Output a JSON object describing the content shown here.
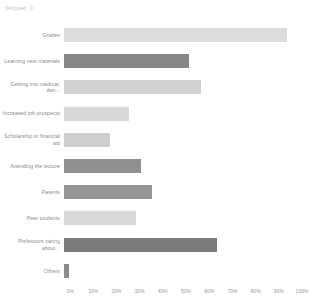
{
  "header": {
    "skipped_text": "Skipped: 0"
  },
  "chart_data": {
    "type": "bar",
    "orientation": "horizontal",
    "title": "",
    "xlabel": "",
    "ylabel": "",
    "xlim": [
      0,
      100
    ],
    "grid": false,
    "legend": "none",
    "tick_labels": [
      "0%",
      "10%",
      "20%",
      "30%",
      "40%",
      "50%",
      "60%",
      "70%",
      "80%",
      "90%",
      "100%"
    ],
    "tick_values": [
      0,
      10,
      20,
      30,
      40,
      50,
      60,
      70,
      80,
      90,
      100
    ],
    "categories": [
      "Grades",
      "Learning new materials",
      "Getting into medical, den...",
      "Increased job prospects",
      "Scholarship or financial aid",
      "Attending the lecture",
      "Parents",
      "Peer students",
      "Professors caring about...",
      "Others"
    ],
    "values": [
      96,
      54,
      59,
      28,
      20,
      33,
      38,
      31,
      66,
      2
    ],
    "colors": [
      "#dcdcdc",
      "#878787",
      "#d2d2d2",
      "#d8d8d8",
      "#cfcfcf",
      "#8f8f8f",
      "#959595",
      "#d9d9d9",
      "#7a7a7a",
      "#8b8b8b"
    ]
  }
}
